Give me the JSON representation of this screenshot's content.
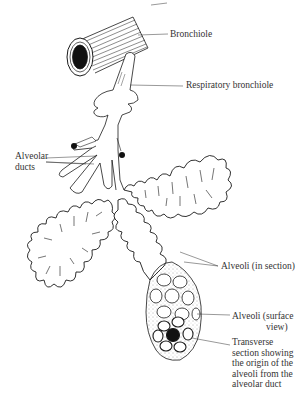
{
  "diagram": {
    "labels": {
      "bronchiole": "Bronchiole",
      "respiratory_bronchiole": "Respiratory bronchiole",
      "alveolar_ducts_line1": "Alveolar",
      "alveolar_ducts_line2": "ducts",
      "alveoli_section": "Alveoli (in section)",
      "alveoli_surface_line1": "Alveoli (surface",
      "alveoli_surface_line2": "view)",
      "transverse_line1": "Transverse",
      "transverse_line2": "section showing",
      "transverse_line3": "the origin of the",
      "transverse_line4": "alveoli from the",
      "transverse_line5": "alveolar duct"
    },
    "colors": {
      "ink": "#1a1a1a",
      "paper": "#ffffff",
      "label": "#333333"
    }
  }
}
